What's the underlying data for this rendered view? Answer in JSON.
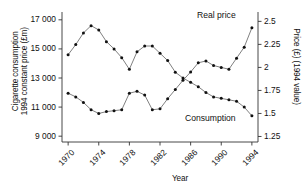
{
  "chart_data": {
    "type": "line",
    "title": "",
    "xlabel": "Year",
    "ylabel_left": "Cigarette consumption\n1994 constant price (£m)",
    "ylabel_right": "Price (£) (1994 value)",
    "x": [
      1970,
      1971,
      1972,
      1973,
      1974,
      1975,
      1976,
      1977,
      1978,
      1979,
      1980,
      1981,
      1982,
      1983,
      1984,
      1985,
      1986,
      1987,
      1988,
      1989,
      1990,
      1991,
      1992,
      1993,
      1994
    ],
    "xlim": [
      1969.2,
      1994.8
    ],
    "xticks": [
      1970,
      1974,
      1978,
      1982,
      1986,
      1990,
      1994
    ],
    "xtick_labels": [
      "1970",
      "1974",
      "1978",
      "1982",
      "1986",
      "1990",
      "1994"
    ],
    "ylim_left": [
      8600,
      17400
    ],
    "yticks_left": [
      9000,
      11000,
      13000,
      15000,
      17000
    ],
    "ytick_labels_left": [
      "9 000",
      "11 000",
      "13 000",
      "15 000",
      "17 000"
    ],
    "ylim_right": [
      1.19,
      2.58
    ],
    "yticks_right": [
      1.25,
      1.5,
      1.75,
      2,
      2.25,
      2.5
    ],
    "ytick_labels_right": [
      "1.25",
      "1.5",
      "1.75",
      "2",
      "2.25",
      "2.5"
    ],
    "grid": false,
    "legend_position": "inline-annotations",
    "series": [
      {
        "name": "Consumption",
        "axis": "left",
        "units": "£m (1994 constant price)",
        "label_text": "Consumption",
        "marker": "filled-circle",
        "values": [
          14600,
          15300,
          16100,
          16600,
          16300,
          15500,
          15000,
          14400,
          13600,
          14800,
          15200,
          15200,
          14700,
          14200,
          13400,
          13000,
          12700,
          12400,
          12000,
          11700,
          11600,
          11500,
          11400,
          11000,
          10400
        ]
      },
      {
        "name": "Real price",
        "axis": "right",
        "units": "£ (1994 value)",
        "label_text": "Real price",
        "marker": "filled-circle",
        "values": [
          1.72,
          1.68,
          1.62,
          1.54,
          1.5,
          1.52,
          1.53,
          1.54,
          1.72,
          1.74,
          1.7,
          1.54,
          1.55,
          1.66,
          1.76,
          1.86,
          1.95,
          2.05,
          2.07,
          2.02,
          2.0,
          1.98,
          2.1,
          2.22,
          2.43
        ]
      }
    ]
  },
  "axes": {
    "xlabel": "Year",
    "ylabel_left_line1": "Cigarette consumption",
    "ylabel_left_line2": "1994 constant price (£m)",
    "ylabel_right": "Price (£) (1994 value)"
  },
  "annotations": {
    "real_price": "Real price",
    "consumption": "Consumption"
  },
  "colors": {
    "line": "#555555",
    "marker": "#111111",
    "axis": "#333333",
    "background": "#ffffff"
  }
}
